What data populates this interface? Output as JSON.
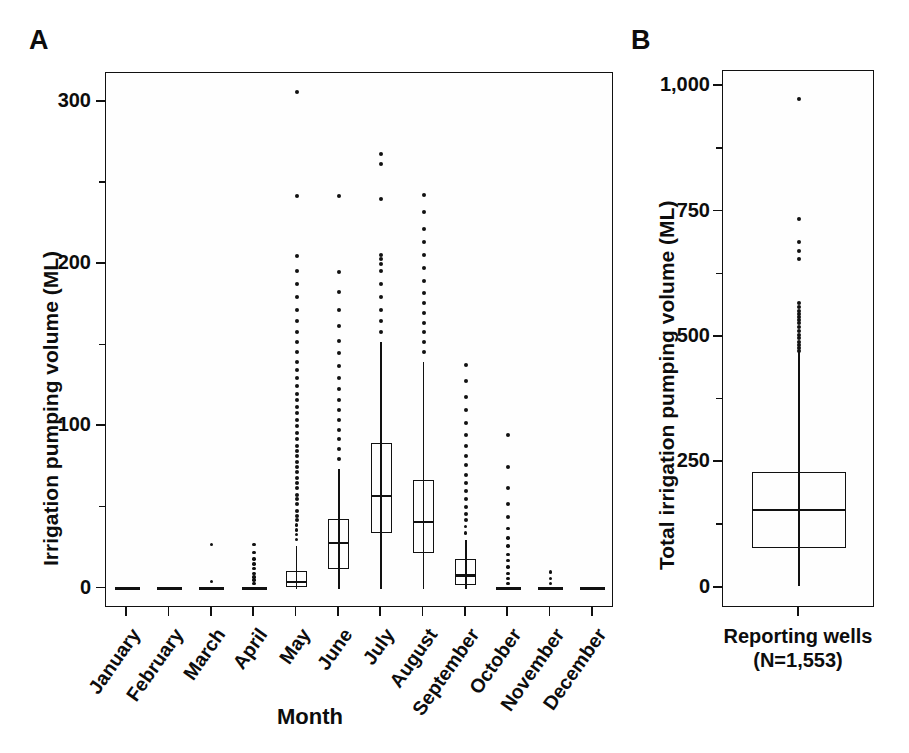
{
  "figure": {
    "panels": [
      {
        "letter": "A",
        "ylabel": "Irrigation pumping volume (ML)",
        "xlabel": "Month"
      },
      {
        "letter": "B",
        "ylabel": "Total irrigation pumping volume (ML)",
        "category_label_line1": "Reporting wells",
        "category_label_line2": "(N=1,553)"
      }
    ]
  },
  "chart_data": [
    {
      "type": "box",
      "panel": "A",
      "title": "",
      "xlabel": "Month",
      "ylabel": "Irrigation pumping volume (ML)",
      "ylim": [
        -12,
        318
      ],
      "yticks": [
        0,
        100,
        200,
        300
      ],
      "ytick_labels": [
        "0",
        "100",
        "200",
        "300"
      ],
      "yticks_minor": [
        50,
        150,
        250
      ],
      "grid": false,
      "legend": "none",
      "categories": [
        "January",
        "February",
        "March",
        "April",
        "May",
        "June",
        "July",
        "August",
        "September",
        "October",
        "November",
        "December"
      ],
      "boxes": [
        {
          "category": "January",
          "min": 0,
          "q1": 0,
          "median": 0,
          "q3": 0,
          "max": 0,
          "outliers": []
        },
        {
          "category": "February",
          "min": 0,
          "q1": 0,
          "median": 0,
          "q3": 0,
          "max": 0,
          "outliers": []
        },
        {
          "category": "March",
          "min": 0,
          "q1": 0,
          "median": 0,
          "q3": 0,
          "max": 0,
          "outliers": [
            4,
            27
          ]
        },
        {
          "category": "April",
          "min": 0,
          "q1": 0,
          "median": 0,
          "q3": 0,
          "max": 0,
          "outliers": [
            3,
            5,
            7,
            9,
            12,
            15,
            18,
            22,
            27
          ]
        },
        {
          "category": "May",
          "min": 0,
          "q1": 1,
          "median": 4,
          "q3": 11,
          "max": 26,
          "outliers": [
            30,
            33,
            36,
            39,
            42,
            45,
            48,
            52,
            55,
            58,
            62,
            65,
            68,
            72,
            75,
            78,
            82,
            85,
            88,
            92,
            96,
            100,
            104,
            108,
            112,
            116,
            120,
            125,
            130,
            135,
            140,
            146,
            152,
            158,
            165,
            172,
            180,
            188,
            196,
            205,
            242,
            306
          ]
        },
        {
          "category": "June",
          "min": 0,
          "q1": 12,
          "median": 28,
          "q3": 43,
          "max": 74,
          "outliers": [
            80,
            86,
            92,
            98,
            104,
            110,
            116,
            123,
            130,
            137,
            145,
            153,
            162,
            172,
            183,
            195,
            242
          ]
        },
        {
          "category": "July",
          "min": 0,
          "q1": 34,
          "median": 57,
          "q3": 90,
          "max": 152,
          "outliers": [
            158,
            165,
            172,
            180,
            188,
            196,
            200,
            203,
            206,
            240,
            262,
            268
          ]
        },
        {
          "category": "August",
          "min": 0,
          "q1": 22,
          "median": 41,
          "q3": 67,
          "max": 140,
          "outliers": [
            146,
            152,
            158,
            164,
            170,
            176,
            182,
            190,
            198,
            206,
            214,
            222,
            232,
            243
          ]
        },
        {
          "category": "September",
          "min": 0,
          "q1": 2,
          "median": 8,
          "q3": 18,
          "max": 30,
          "outliers": [
            34,
            38,
            42,
            46,
            50,
            55,
            60,
            65,
            70,
            76,
            82,
            88,
            95,
            102,
            110,
            118,
            128,
            138
          ]
        },
        {
          "category": "October",
          "min": 0,
          "q1": 0,
          "median": 0,
          "q3": 0,
          "max": 0,
          "outliers": [
            3,
            6,
            9,
            13,
            17,
            21,
            26,
            31,
            37,
            44,
            52,
            62,
            75,
            95
          ]
        },
        {
          "category": "November",
          "min": 0,
          "q1": 0,
          "median": 0,
          "q3": 0,
          "max": 0,
          "outliers": [
            3,
            6,
            10
          ]
        },
        {
          "category": "December",
          "min": 0,
          "q1": 0,
          "median": 0,
          "q3": 0,
          "max": 0,
          "outliers": []
        }
      ]
    },
    {
      "type": "box",
      "panel": "B",
      "title": "",
      "xlabel": "",
      "ylabel": "Total irrigation pumping volume (ML)",
      "ylim": [
        -40,
        1030
      ],
      "yticks": [
        0,
        250,
        500,
        750,
        1000
      ],
      "ytick_labels": [
        "0",
        "250",
        "500",
        "750",
        "1,000"
      ],
      "yticks_minor": [
        125,
        375,
        625,
        875
      ],
      "grid": false,
      "legend": "none",
      "categories": [
        "Reporting wells (N=1,553)"
      ],
      "boxes": [
        {
          "category": "Reporting wells",
          "min": 4,
          "q1": 80,
          "median": 156,
          "q3": 230,
          "max": 470,
          "outliers": [
            472,
            478,
            484,
            490,
            497,
            504,
            512,
            520,
            528,
            534,
            540,
            546,
            552,
            560,
            568,
            655,
            672,
            690,
            735,
            975
          ]
        }
      ]
    }
  ]
}
